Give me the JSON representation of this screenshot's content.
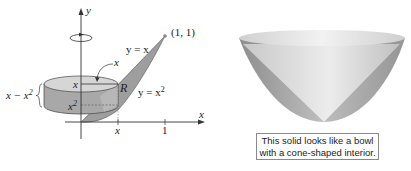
{
  "left_figure": {
    "axis_y_label": "y",
    "axis_x_label": "x",
    "point_label": "(1, 1)",
    "curve_upper_label": "y = x",
    "curve_lower_label_base": "y = x",
    "curve_lower_label_exp": "2",
    "region_label": "R",
    "radius_label": "x",
    "top_height_label": "x",
    "bottom_height_label_base": "x",
    "bottom_height_label_exp": "2",
    "thickness_label_base": "x − x",
    "thickness_label_exp": "2",
    "tick_x_label": "x",
    "tick_one_label": "1",
    "rotation_icon": "rotation-arrow-icon",
    "colors": {
      "solid_fill": "#a9a9a9",
      "top_fill": "#d4d4d4",
      "region_fill": "#9e9e9e",
      "line": "#333333"
    }
  },
  "right_figure": {
    "description": "Bowl-shaped solid with cone-shaped interior",
    "colors": {
      "outer_shade": "#9a9a9a",
      "inner_light": "#e2e2e2",
      "rim": "#ececec"
    }
  },
  "caption": {
    "line1": "This solid looks like a bowl",
    "line2": "with a cone-shaped interior."
  }
}
